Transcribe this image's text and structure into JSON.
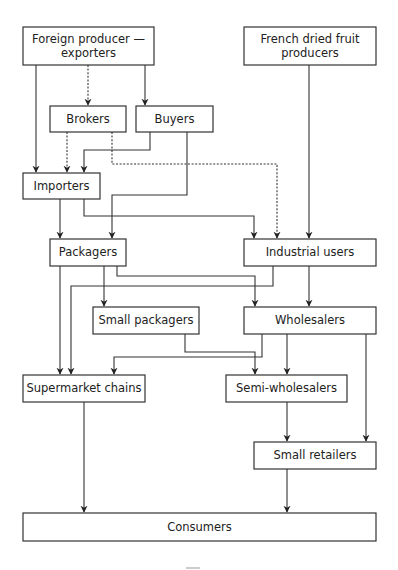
{
  "diagram": {
    "type": "flowchart",
    "nodes": {
      "foreign": {
        "label_1": "Foreign producer —",
        "label_2": "exporters"
      },
      "french": {
        "label_1": "French dried fruit",
        "label_2": "producers"
      },
      "brokers": {
        "label": "Brokers"
      },
      "buyers": {
        "label": "Buyers"
      },
      "importers": {
        "label": "Importers"
      },
      "packagers": {
        "label": "Packagers"
      },
      "industrial": {
        "label": "Industrial users"
      },
      "small_packagers": {
        "label": "Small packagers"
      },
      "wholesalers": {
        "label": "Wholesalers"
      },
      "supermarket": {
        "label": "Supermarket chains"
      },
      "semi_wholesalers": {
        "label": "Semi-wholesalers"
      },
      "small_retailers": {
        "label": "Small retailers"
      },
      "consumers": {
        "label": "Consumers"
      }
    },
    "edges": [
      {
        "from": "Foreign producer — exporters",
        "to": "Importers",
        "style": "solid"
      },
      {
        "from": "Foreign producer — exporters",
        "to": "Brokers",
        "style": "dotted"
      },
      {
        "from": "Foreign producer — exporters",
        "to": "Buyers",
        "style": "solid"
      },
      {
        "from": "Brokers",
        "to": "Importers",
        "style": "dotted"
      },
      {
        "from": "Brokers",
        "to": "Industrial users",
        "style": "dotted"
      },
      {
        "from": "Buyers",
        "to": "Importers",
        "style": "solid"
      },
      {
        "from": "Buyers",
        "to": "Packagers",
        "style": "solid"
      },
      {
        "from": "French dried fruit producers",
        "to": "Industrial users",
        "style": "solid"
      },
      {
        "from": "Importers",
        "to": "Packagers",
        "style": "solid"
      },
      {
        "from": "Importers",
        "to": "Industrial users",
        "style": "solid"
      },
      {
        "from": "Packagers",
        "to": "Supermarket chains",
        "style": "solid"
      },
      {
        "from": "Packagers",
        "to": "Small packagers",
        "style": "solid"
      },
      {
        "from": "Packagers",
        "to": "Wholesalers",
        "style": "solid"
      },
      {
        "from": "Industrial users",
        "to": "Supermarket chains",
        "style": "solid"
      },
      {
        "from": "Industrial users",
        "to": "Wholesalers",
        "style": "solid"
      },
      {
        "from": "Small packagers",
        "to": "Semi-wholesalers",
        "style": "solid"
      },
      {
        "from": "Wholesalers",
        "to": "Supermarket chains",
        "style": "solid"
      },
      {
        "from": "Wholesalers",
        "to": "Semi-wholesalers",
        "style": "solid"
      },
      {
        "from": "Wholesalers",
        "to": "Small retailers",
        "style": "solid"
      },
      {
        "from": "Semi-wholesalers",
        "to": "Small retailers",
        "style": "solid"
      },
      {
        "from": "Supermarket chains",
        "to": "Consumers",
        "style": "solid"
      },
      {
        "from": "Small retailers",
        "to": "Consumers",
        "style": "solid"
      }
    ]
  },
  "colors": {
    "line": "#333333",
    "background": "#ffffff",
    "text": "#222222"
  }
}
